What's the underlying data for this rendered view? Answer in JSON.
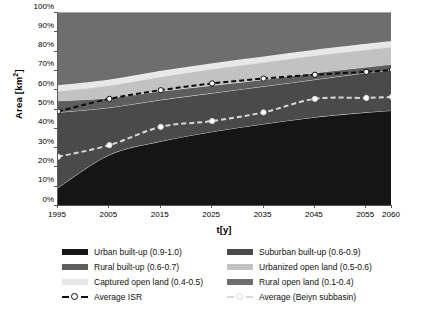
{
  "chart_data": {
    "type": "area",
    "title": "",
    "subtitle": "",
    "xlabel": "t[y]",
    "ylabel": "Area [km2]",
    "ylabel_display": "Area [km",
    "ylabel_sup": "2",
    "ylabel_tail": "]",
    "x": [
      1995,
      2005,
      2015,
      2025,
      2035,
      2045,
      2055,
      2060
    ],
    "xtick_labels": [
      "1995",
      "2005",
      "2015",
      "2025",
      "2035",
      "2045",
      "2055",
      "2060"
    ],
    "ytick_labels": [
      "0%",
      "10%",
      "20%",
      "30%",
      "40%",
      "50%",
      "60%",
      "70%",
      "80%",
      "90%",
      "100%"
    ],
    "ytick_values": [
      0,
      10,
      20,
      30,
      40,
      50,
      60,
      70,
      80,
      90,
      100
    ],
    "ylim": [
      0,
      100
    ],
    "xlim": [
      1995,
      2060
    ],
    "grid": false,
    "stacked": true,
    "stack_order": "bottom-to-top",
    "legend_position": "below",
    "plot_background": "#6e6e6e",
    "series": [
      {
        "name": "Urban built-up (0.9-1.0)",
        "color": "#151515",
        "values": [
          9,
          26,
          33,
          38,
          42,
          45.5,
          48,
          49
        ]
      },
      {
        "name": "Suburban built-up (0.6-0.9)",
        "color": "#4a4a4a",
        "values": [
          39,
          24.5,
          21.5,
          20,
          19.5,
          19.5,
          20.5,
          21
        ]
      },
      {
        "name": "Rural built-up (0.6-0.7)",
        "color": "#5e5e5e",
        "values": [
          6,
          5,
          4.5,
          4,
          3.5,
          3.5,
          3,
          3
        ]
      },
      {
        "name": "Urbanized open land (0.5-0.6)",
        "color": "#c2c2c2",
        "values": [
          5,
          6.5,
          7.5,
          8.5,
          9,
          9,
          9,
          9
        ]
      },
      {
        "name": "Captured open land (0.4-0.5)",
        "color": "#e8e8e8",
        "values": [
          3,
          3,
          3,
          3,
          3,
          3,
          3,
          3
        ]
      },
      {
        "name": "Rural open land (0.1-0.4)",
        "color": "#6e6e6e",
        "values": [
          38,
          35,
          30.5,
          26.5,
          23,
          19.5,
          16.5,
          15
        ]
      }
    ],
    "overlay_lines": [
      {
        "name": "Average ISR",
        "color": "#0d0d0d",
        "marker_fill": "#ffffff",
        "style": "dashed",
        "values": [
          48.5,
          55,
          59.5,
          63,
          65.5,
          67.5,
          69,
          70
        ]
      },
      {
        "name": "Average (Beiyn subbasin)",
        "color": "#d8d8d8",
        "marker_fill": "#ffffff",
        "style": "dashed",
        "values": [
          25,
          31,
          40.5,
          43.5,
          48,
          55,
          55.5,
          56
        ]
      }
    ]
  },
  "legend": {
    "rows": [
      {
        "left": {
          "label": "Urban built-up (0.9-1.0)",
          "color": "#151515",
          "kind": "swatch"
        },
        "right": {
          "label": "Suburban built-up (0.6-0.9)",
          "color": "#4a4a4a",
          "kind": "swatch"
        }
      },
      {
        "left": {
          "label": "Rural built-up (0.6-0.7)",
          "color": "#5e5e5e",
          "kind": "swatch"
        },
        "right": {
          "label": "Urbanized open land (0.5-0.6)",
          "color": "#c2c2c2",
          "kind": "swatch"
        }
      },
      {
        "left": {
          "label": "Captured open land (0.4-0.5)",
          "color": "#e8e8e8",
          "kind": "swatch"
        },
        "right": {
          "label": "Rural open land (0.1-0.4)",
          "color": "#6e6e6e",
          "kind": "swatch"
        }
      },
      {
        "left": {
          "label": "Average ISR",
          "color": "#0d0d0d",
          "kind": "line-marker"
        },
        "right": {
          "label": "Average (Beiyn subbasin)",
          "color": "#d8d8d8",
          "kind": "line-marker"
        }
      }
    ]
  },
  "caption": {
    "text": ""
  }
}
